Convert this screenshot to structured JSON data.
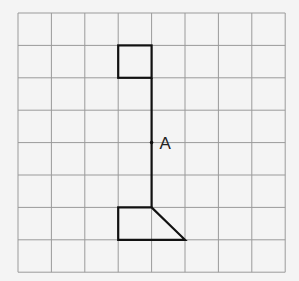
{
  "diagram": {
    "grid": {
      "columns": 8,
      "rows": 8,
      "left": 18,
      "top": 13,
      "cell_width": 33.4,
      "cell_height": 32.4,
      "line_color": "#9a9a9a",
      "background": "#f4f4f4"
    },
    "figure": {
      "stroke_color": "#111111",
      "square": {
        "col": 3,
        "row": 1,
        "w": 1,
        "h": 1
      },
      "stem": {
        "col": 4,
        "row_from": 2,
        "row_to": 6
      },
      "base": {
        "points_grid": [
          [
            3,
            6
          ],
          [
            4,
            6
          ],
          [
            5,
            7
          ],
          [
            3,
            7
          ]
        ]
      }
    },
    "point": {
      "label": "A",
      "col": 4,
      "row": 4
    }
  }
}
